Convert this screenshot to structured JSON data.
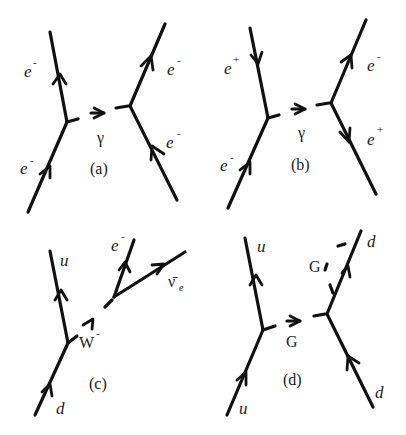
{
  "figure": {
    "diagrams": [
      {
        "id": "a",
        "caption": "(a)",
        "boson_label": "γ",
        "particles": {
          "left_top": {
            "base": "e",
            "sup": "-"
          },
          "left_bottom": {
            "base": "e",
            "sup": "-"
          },
          "right_top": {
            "base": "e",
            "sup": "-"
          },
          "right_bottom": {
            "base": "e",
            "sup": "-"
          }
        }
      },
      {
        "id": "b",
        "caption": "(b)",
        "boson_label": "γ",
        "particles": {
          "left_top": {
            "base": "e",
            "sup": "+"
          },
          "left_bottom": {
            "base": "e",
            "sup": "-"
          },
          "right_top": {
            "base": "e",
            "sup": "-"
          },
          "right_bottom": {
            "base": "e",
            "sup": "+"
          }
        }
      },
      {
        "id": "c",
        "caption": "(c)",
        "boson_label": "W",
        "boson_sup": "-",
        "particles": {
          "quark_top": "u",
          "quark_bottom": "d",
          "lepton": {
            "base": "e",
            "sup": "-"
          },
          "antineutrino": {
            "base": "ν̄",
            "sub": "e"
          }
        }
      },
      {
        "id": "d",
        "caption": "(d)",
        "boson_label": "G",
        "emitted_label": "G",
        "particles": {
          "left_top": "u",
          "left_bottom": "u",
          "right_top": "d",
          "right_bottom": "d"
        }
      }
    ]
  }
}
